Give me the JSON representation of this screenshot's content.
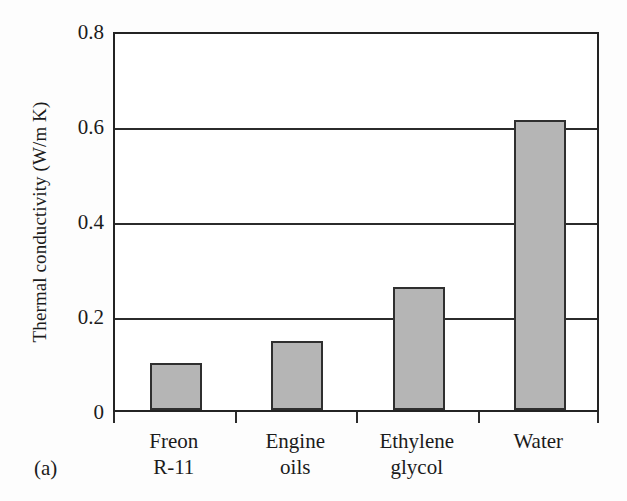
{
  "figure": {
    "panel_label": "(a)",
    "background_color": "#fdfdfd",
    "axis_color": "#2b2b2b",
    "bar_fill_color": "#b5b5b5",
    "bar_border_color": "#2f2f2f"
  },
  "chart_data": {
    "type": "bar",
    "title": "",
    "xlabel": "",
    "ylabel": "Thermal conductivity (W/m K)",
    "categories": [
      "Freon R-11",
      "Engine oils",
      "Ethylene glycol",
      "Water"
    ],
    "category_lines": [
      [
        "Freon",
        "R-11"
      ],
      [
        "Engine",
        "oils"
      ],
      [
        "Ethylene",
        "glycol"
      ],
      [
        "Water"
      ]
    ],
    "values": [
      0.1,
      0.145,
      0.26,
      0.61
    ],
    "ylim": [
      0,
      0.8
    ],
    "yticks": [
      0,
      0.2,
      0.4,
      0.6,
      0.8
    ],
    "ytick_labels": [
      "0",
      "0.2",
      "0.4",
      "0.6",
      "0.8"
    ],
    "grid": true,
    "grid_axis": "y",
    "legend": false,
    "units": "W/m K"
  }
}
